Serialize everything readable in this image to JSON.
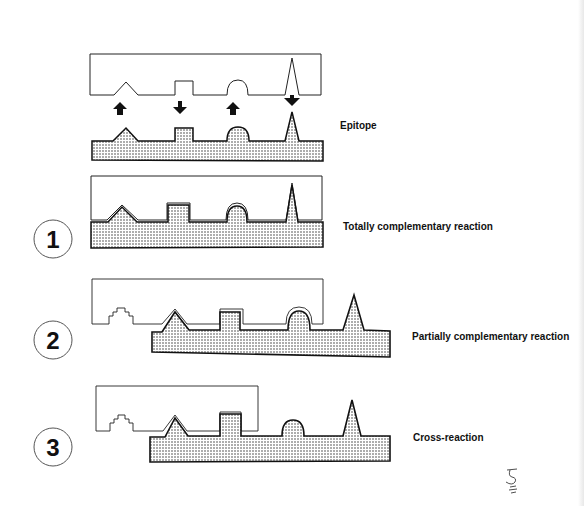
{
  "figure": {
    "type": "antigen-antibody binding diagram",
    "panels": [
      {
        "id": "epitope",
        "number": null,
        "label": "Epitope"
      },
      {
        "id": "panel-1",
        "number": "1",
        "label": "Totally complementary reaction"
      },
      {
        "id": "panel-2",
        "number": "2",
        "label": "Partially complementary reaction"
      },
      {
        "id": "panel-3",
        "number": "3",
        "label": "Cross-reaction"
      }
    ],
    "epitope_shapes": [
      "triangle",
      "square",
      "semicircle",
      "spike"
    ],
    "arrows": [
      "up",
      "down",
      "up",
      "down"
    ],
    "signature": "signature-mark"
  },
  "labels": {
    "epitope": "Epitope",
    "panel1": "Totally complementary reaction",
    "panel2": "Partially complementary reaction",
    "panel3": "Cross-reaction",
    "num1": "1",
    "num2": "2",
    "num3": "3"
  },
  "colors": {
    "ink": "#111111",
    "stipple": "#333333",
    "background": "#ffffff"
  }
}
